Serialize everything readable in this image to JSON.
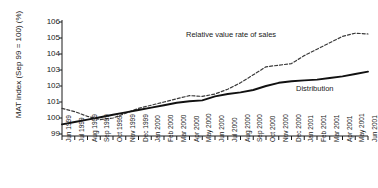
{
  "chart_data": {
    "type": "line",
    "title": "",
    "xlabel": "",
    "ylabel": "MAT index (Sep 99 = 100) (%)",
    "ylim": [
      99,
      106
    ],
    "yticks": [
      99,
      100,
      101,
      102,
      103,
      104,
      105,
      106
    ],
    "grid": false,
    "legend_position": "inline-annotation",
    "categories": [
      "Jun 1999",
      "Jul 1999",
      "Aug 1999",
      "Sep 1999",
      "Oct 1999",
      "Nov 1999",
      "Dec 1999",
      "Jan 2000",
      "Feb 2000",
      "Mar 2000",
      "Apr 2000",
      "May 2000",
      "Jun 2000",
      "Jul 2000",
      "Aug 2000",
      "Sep 2000",
      "Oct 2000",
      "Nov 2000",
      "Dec 2000",
      "Jan 2001",
      "Feb 2001",
      "Mar 2001",
      "Apr 2001",
      "May 2001",
      "Jun 2001"
    ],
    "series": [
      {
        "name": "Relative value rate of sales",
        "style": "dashed",
        "color": "#3a3a3a",
        "values": [
          100.6,
          100.4,
          100.1,
          99.9,
          100.0,
          100.3,
          100.6,
          100.8,
          101.0,
          101.2,
          101.4,
          101.35,
          101.5,
          101.8,
          102.2,
          102.7,
          103.2,
          103.3,
          103.4,
          103.9,
          104.3,
          104.7,
          105.1,
          105.3,
          105.25
        ]
      },
      {
        "name": "Distribution",
        "style": "solid",
        "color": "#111111",
        "values": [
          99.6,
          99.75,
          99.9,
          100.05,
          100.2,
          100.35,
          100.5,
          100.65,
          100.8,
          100.95,
          101.05,
          101.1,
          101.35,
          101.5,
          101.6,
          101.75,
          102.0,
          102.2,
          102.3,
          102.35,
          102.4,
          102.5,
          102.6,
          102.75,
          102.9
        ]
      }
    ],
    "annotations": [
      {
        "text": "Relative value rate of sales",
        "series": "Relative value rate of sales"
      },
      {
        "text": "Distribution",
        "series": "Distribution"
      }
    ]
  }
}
